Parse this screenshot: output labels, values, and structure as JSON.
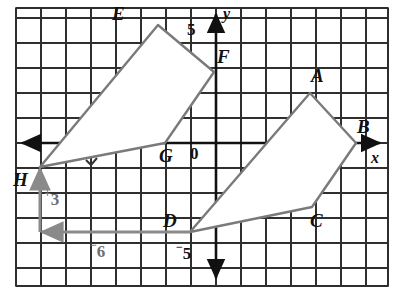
{
  "figure": {
    "kind": "coordinate-grid-translation-diagram",
    "grid": {
      "spacing_px": 25,
      "origin_px": {
        "x": 215,
        "y": 143
      },
      "border": {
        "x": 16,
        "y": 8,
        "width": 372,
        "height": 278
      },
      "line_color": "#2b2b2b",
      "background": "#ffffff"
    },
    "axes": {
      "x_label": "x",
      "y_label": "y",
      "color": "#111111",
      "tick_labels": [
        {
          "name": "y-tick-5",
          "text": "5",
          "x": 188,
          "y": 22
        },
        {
          "name": "y-tick-neg5",
          "text": "5",
          "negative": true,
          "x": 178,
          "y": 244
        }
      ]
    },
    "polygons": [
      {
        "name": "preimage-abcd",
        "vertices": [
          {
            "label": "A",
            "px": {
              "x": 310,
              "y": 93
            },
            "grid": {
              "x": 3.8,
              "y": 2.0
            }
          },
          {
            "label": "B",
            "px": {
              "x": 356,
              "y": 143
            },
            "grid": {
              "x": 5.6,
              "y": 0.0
            }
          },
          {
            "label": "C",
            "px": {
              "x": 312,
              "y": 207
            },
            "grid": {
              "x": 3.9,
              "y": -2.6
            }
          },
          {
            "label": "D",
            "px": {
              "x": 190,
              "y": 232
            },
            "grid": {
              "x": -1.0,
              "y": -3.6
            }
          }
        ],
        "stroke": "#7a7a7a",
        "fill": "#ffffff"
      },
      {
        "name": "image-efgh",
        "vertices": [
          {
            "label": "E",
            "px": {
              "x": 158,
              "y": 25
            },
            "grid": {
              "x": -2.3,
              "y": 4.7
            }
          },
          {
            "label": "F",
            "px": {
              "x": 214,
              "y": 72
            },
            "grid": {
              "x": 0.0,
              "y": 2.8
            }
          },
          {
            "label": "G",
            "px": {
              "x": 165,
              "y": 143
            },
            "grid": {
              "x": -2.0,
              "y": 0.0
            }
          },
          {
            "label": "H",
            "px": {
              "x": 40,
              "y": 167
            },
            "grid": {
              "x": -7.0,
              "y": -1.0
            }
          }
        ],
        "stroke": "#7a7a7a",
        "fill": "#ffffff"
      }
    ],
    "vertex_labels": [
      {
        "name": "vertex-label-a",
        "text": "A",
        "x": 311,
        "y": 66
      },
      {
        "name": "vertex-label-b",
        "text": "B",
        "x": 357,
        "y": 117
      },
      {
        "name": "vertex-label-c",
        "text": "C",
        "x": 310,
        "y": 211
      },
      {
        "name": "vertex-label-d",
        "text": "D",
        "x": 163,
        "y": 211
      },
      {
        "name": "vertex-label-e",
        "text": "E",
        "x": 112,
        "y": 4
      },
      {
        "name": "vertex-label-f",
        "text": "F",
        "x": 217,
        "y": 47
      },
      {
        "name": "vertex-label-g",
        "text": "G",
        "x": 160,
        "y": 146
      },
      {
        "name": "vertex-label-h",
        "text": "H",
        "x": 14,
        "y": 170
      }
    ],
    "origin_label": {
      "name": "origin-label",
      "text": "0",
      "x": 190,
      "y": 146
    },
    "translation": {
      "name": "translation-vector",
      "color": "#8a8a8a",
      "horizontal": {
        "label": "6",
        "negative": true,
        "label_x": 92,
        "label_y": 243,
        "from_px": {
          "x": 190,
          "y": 232
        },
        "to_px": {
          "x": 40,
          "y": 232
        }
      },
      "vertical": {
        "label": "3",
        "positive": true,
        "label_x": 42,
        "label_y": 190,
        "from_px": {
          "x": 40,
          "y": 232
        },
        "to_px": {
          "x": 40,
          "y": 167
        }
      }
    }
  }
}
